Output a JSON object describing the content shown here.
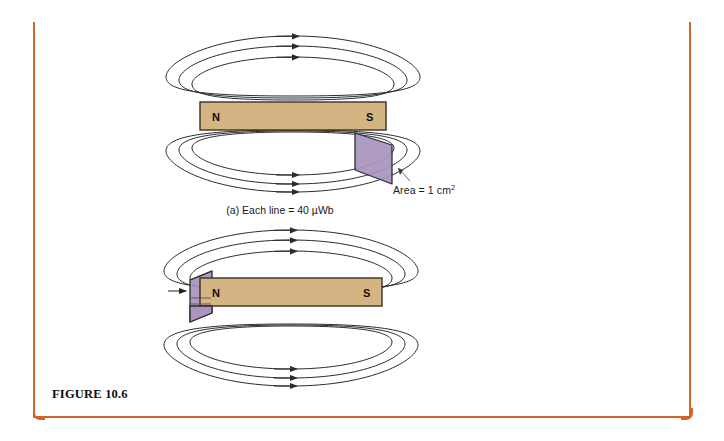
{
  "figure": {
    "caption_label": "FIGURE 10.6",
    "border_color": "#D4622A",
    "background_color": "#FFFFFF"
  },
  "colors": {
    "magnet_fill": "#D4B483",
    "magnet_stroke": "#3B3026",
    "flux_surface_fill": "#A995BE",
    "flux_surface_stroke": "#2E2A33",
    "field_line_stroke": "#2B2B2B",
    "text": "#1A1A1A"
  },
  "diagram_a": {
    "name": "magnetic-flux-small-area",
    "magnet": {
      "north_pole_label": "N",
      "south_pole_label": "S"
    },
    "field_lines": {
      "loops_above": 3,
      "loops_below": 3,
      "arrow_direction": "right"
    },
    "surface": {
      "position": "south-end",
      "area_label": "Area = 1 cm",
      "area_exponent": "2"
    },
    "caption": "(a) Each line = 40 µWb"
  },
  "diagram_b": {
    "name": "magnetic-flux-large-area",
    "magnet": {
      "north_pole_label": "N",
      "south_pole_label": "S"
    },
    "field_lines": {
      "loops_above": 3,
      "loops_below": 3,
      "arrow_direction": "right"
    },
    "surface": {
      "position": "north-end",
      "area_label": "Area = 3 cm",
      "area_exponent": "2",
      "has_pointer_arrow": true
    },
    "caption": "(b) Each line = 75 µWb"
  }
}
